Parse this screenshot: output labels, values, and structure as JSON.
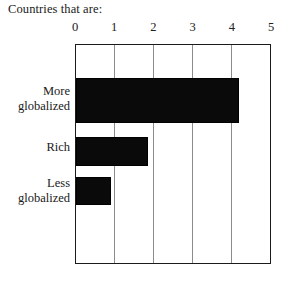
{
  "chart_data": {
    "type": "bar",
    "orientation": "horizontal",
    "title": "Countries that are:",
    "xlabel": "",
    "ylabel": "",
    "categories": [
      "More globalized",
      "Rich",
      "Less globalized"
    ],
    "category_lines": [
      [
        "More",
        "globalized"
      ],
      [
        "Rich"
      ],
      [
        "Less",
        "globalized"
      ]
    ],
    "values": [
      4.2,
      1.85,
      0.9
    ],
    "xlim": [
      0,
      5
    ],
    "xticks": [
      0,
      1,
      2,
      3,
      4,
      5
    ],
    "xtick_labels": [
      "0",
      "1",
      "2",
      "3",
      "4",
      "5"
    ],
    "grid": "vertical",
    "legend": "none",
    "bar_color": "#0a0a0a",
    "axis_color": "#1b1b1b",
    "gridline_color": "#8c8c8c",
    "background": "#ffffff"
  },
  "title": {
    "text": "Countries that are:"
  },
  "axis": {
    "tick_0": "0",
    "tick_1": "1",
    "tick_2": "2",
    "tick_3": "3",
    "tick_4": "4",
    "tick_5": "5"
  },
  "labels": {
    "more_line1": "More",
    "more_line2": "globalized",
    "rich_line1": "Rich",
    "less_line1": "Less",
    "less_line2": "globalized"
  }
}
